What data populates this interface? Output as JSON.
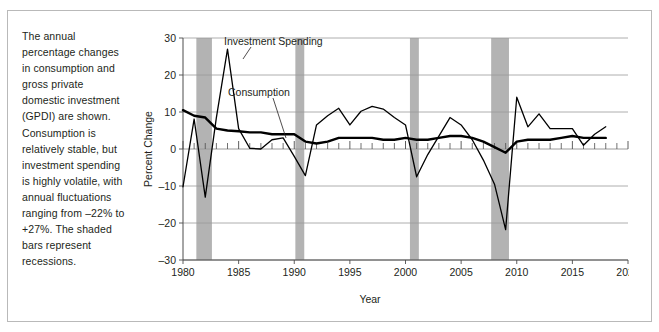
{
  "caption": {
    "text": "The annual percentage changes in consumption and gross private domestic investment (GPDI) are shown. Consumption is relatively stable, but investment spending is highly volatile, with annual fluctuations ranging from –22% to +27%. The shaded bars represent recessions."
  },
  "annotations": {
    "investment_label": "Investment Spending",
    "consumption_label": "Consumption"
  },
  "colors": {
    "line": "#000000",
    "recession_bar": "#b3b3b3",
    "gridline": "#9a9a9a",
    "axis": "#4d4d4d",
    "text": "#231f20",
    "frame": "#b9b9b9"
  },
  "chart_data": {
    "type": "line",
    "title": "",
    "xlabel": "Year",
    "ylabel": "Percent Change",
    "xlim": [
      1980,
      2020
    ],
    "ylim": [
      -30,
      30
    ],
    "xticks": [
      1980,
      1985,
      1990,
      1995,
      2000,
      2005,
      2010,
      2015,
      2020
    ],
    "yticks": [
      -30,
      -20,
      -10,
      0,
      10,
      20,
      30
    ],
    "grid": true,
    "legend_position": "inline-annotations",
    "minor_xtick_interval": 1,
    "x": [
      1980,
      1981,
      1982,
      1983,
      1984,
      1985,
      1986,
      1987,
      1988,
      1989,
      1990,
      1991,
      1992,
      1993,
      1994,
      1995,
      1996,
      1997,
      1998,
      1999,
      2000,
      2001,
      2002,
      2003,
      2004,
      2005,
      2006,
      2007,
      2008,
      2009,
      2010,
      2011,
      2012,
      2013,
      2014,
      2015,
      2016,
      2017,
      2018
    ],
    "series": [
      {
        "name": "Investment Spending",
        "values": [
          -10.2,
          8.1,
          -13.0,
          8.5,
          27.0,
          5.5,
          0.2,
          0.0,
          2.5,
          3.0,
          -2.0,
          -7.2,
          6.5,
          9.0,
          11.0,
          6.5,
          10.2,
          11.5,
          10.8,
          8.5,
          6.5,
          -7.5,
          -1.5,
          3.5,
          8.5,
          6.5,
          2.5,
          -3.0,
          -9.5,
          -21.8,
          14.0,
          6.0,
          9.5,
          5.5,
          5.5,
          5.5,
          1.0,
          4.0,
          6.0
        ],
        "style": "thin-line"
      },
      {
        "name": "Consumption",
        "values": [
          10.5,
          9.0,
          8.5,
          5.5,
          5.0,
          4.8,
          4.5,
          4.5,
          4.0,
          4.0,
          4.0,
          2.0,
          1.5,
          2.0,
          3.0,
          3.0,
          3.0,
          3.0,
          2.5,
          2.5,
          3.0,
          2.5,
          2.5,
          3.0,
          3.5,
          3.5,
          3.0,
          2.0,
          0.5,
          -1.0,
          2.0,
          2.5,
          2.5,
          2.5,
          3.0,
          3.5,
          3.0,
          3.0,
          3.0
        ],
        "style": "thick-line"
      }
    ],
    "recession_bands": [
      {
        "start": 1981.2,
        "end": 1982.6
      },
      {
        "start": 1990.1,
        "end": 1990.9
      },
      {
        "start": 2000.4,
        "end": 2001.2
      },
      {
        "start": 2007.7,
        "end": 2009.3
      }
    ]
  }
}
